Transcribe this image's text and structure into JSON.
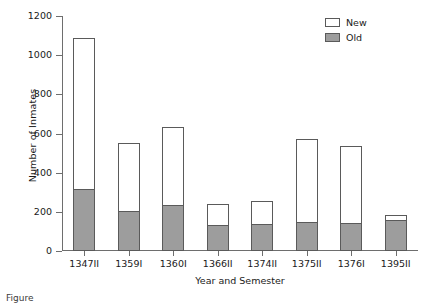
{
  "chart_data": {
    "type": "bar",
    "subtype": "stacked-vertical",
    "title": "",
    "xlabel": "Year and Semester",
    "ylabel": "Number of Inmates",
    "categories": [
      "1347II",
      "1359I",
      "1360I",
      "1366II",
      "1374II",
      "1375II",
      "1376I",
      "1395II"
    ],
    "series": [
      {
        "name": "Old",
        "color": "#9d9d9d",
        "values": [
          315,
          205,
          235,
          135,
          140,
          150,
          145,
          160
        ]
      },
      {
        "name": "New",
        "color": "#ffffff",
        "values": [
          775,
          345,
          400,
          105,
          115,
          420,
          390,
          25
        ]
      }
    ],
    "totals": [
      1090,
      550,
      635,
      240,
      255,
      570,
      535,
      185
    ],
    "ylim": [
      0,
      1200
    ],
    "yticks": [
      0,
      200,
      400,
      600,
      800,
      1000,
      1200
    ],
    "ytick_labels": [
      "0",
      "200",
      "400",
      "600",
      "800",
      "1000",
      "1200"
    ],
    "grid": false,
    "legend_position": "top-right",
    "legend_entries": [
      "New",
      "Old"
    ]
  },
  "caption": {
    "text": "Figure"
  }
}
